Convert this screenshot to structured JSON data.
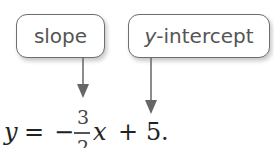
{
  "callouts": {
    "slope": {
      "label": "slope"
    },
    "y_intercept": {
      "variable": "y",
      "label_suffix": "-intercept"
    }
  },
  "equation": {
    "lhs": "y",
    "equals": "=",
    "sign": "−",
    "numerator": "3",
    "denominator": "2",
    "variable": "x",
    "plus": "+",
    "constant": "5",
    "terminator": "."
  },
  "colors": {
    "box_border": "#6e6e6e",
    "arrow": "#666666",
    "text": "#555555"
  }
}
